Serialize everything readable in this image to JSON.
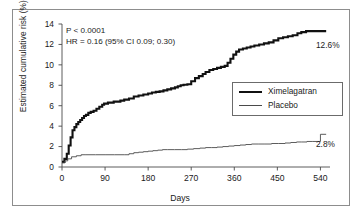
{
  "chart_data": {
    "type": "line",
    "title": "",
    "xlabel": "Days",
    "ylabel": "Estimated cumulative risk (%)",
    "xlim": [
      0,
      560
    ],
    "ylim": [
      0,
      14
    ],
    "xticks": [
      0,
      90,
      180,
      270,
      360,
      450,
      540
    ],
    "yticks": [
      0,
      2,
      4,
      6,
      8,
      10,
      12,
      14
    ],
    "xtick_labels": [
      "0",
      "90",
      "180",
      "270",
      "360",
      "450",
      "540"
    ],
    "ytick_labels": [
      "0",
      "2",
      "4",
      "6",
      "8",
      "10",
      "12",
      "14"
    ],
    "grid": false,
    "legend_position": "center-right",
    "series": [
      {
        "name": "Ximelagatran",
        "color": "#111111",
        "linewidth": 2.1,
        "endpoint_label": "12.6%",
        "endpoint_value": 12.6,
        "x": [
          0,
          5,
          10,
          14,
          18,
          22,
          26,
          30,
          34,
          38,
          42,
          46,
          50,
          55,
          60,
          66,
          72,
          78,
          84,
          88,
          92,
          96,
          102,
          108,
          114,
          122,
          130,
          140,
          150,
          160,
          170,
          180,
          188,
          196,
          204,
          212,
          220,
          228,
          236,
          242,
          248,
          254,
          262,
          270,
          278,
          286,
          294,
          300,
          308,
          316,
          324,
          332,
          340,
          346,
          352,
          358,
          364,
          370,
          378,
          386,
          394,
          402,
          412,
          422,
          432,
          442,
          452,
          462,
          472,
          482,
          492,
          500,
          510,
          520,
          530,
          540,
          552
        ],
        "y": [
          0.5,
          0.8,
          1.3,
          2.1,
          2.9,
          3.6,
          3.9,
          4.2,
          4.4,
          4.6,
          4.8,
          5.0,
          5.1,
          5.3,
          5.4,
          5.5,
          5.7,
          5.9,
          6.1,
          6.2,
          6.2,
          6.3,
          6.3,
          6.4,
          6.4,
          6.5,
          6.6,
          6.7,
          6.9,
          7.0,
          7.1,
          7.2,
          7.3,
          7.35,
          7.4,
          7.5,
          7.6,
          7.7,
          7.8,
          7.9,
          8.0,
          8.05,
          8.1,
          8.4,
          8.7,
          8.9,
          9.1,
          9.3,
          9.5,
          9.6,
          9.7,
          9.8,
          9.9,
          10.2,
          10.6,
          11.0,
          11.3,
          11.5,
          11.6,
          11.7,
          11.8,
          11.9,
          12.0,
          12.1,
          12.2,
          12.4,
          12.6,
          12.7,
          12.8,
          12.9,
          13.1,
          13.2,
          13.3,
          13.3,
          13.3,
          13.3,
          13.3
        ]
      },
      {
        "name": "Placebo",
        "color": "#4a4a4a",
        "linewidth": 0.9,
        "endpoint_label": "2.8%",
        "endpoint_value": 2.8,
        "x": [
          0,
          6,
          12,
          20,
          30,
          40,
          50,
          70,
          90,
          110,
          130,
          140,
          150,
          160,
          170,
          180,
          190,
          200,
          210,
          220,
          235,
          250,
          262,
          275,
          288,
          300,
          312,
          324,
          336,
          348,
          360,
          372,
          384,
          396,
          410,
          424,
          438,
          452,
          466,
          478,
          490,
          500,
          512,
          524,
          534,
          540,
          552
        ],
        "y": [
          0.4,
          0.6,
          0.8,
          1.0,
          1.1,
          1.2,
          1.2,
          1.2,
          1.2,
          1.2,
          1.2,
          1.3,
          1.4,
          1.45,
          1.5,
          1.55,
          1.6,
          1.65,
          1.7,
          1.7,
          1.7,
          1.7,
          1.75,
          1.8,
          1.85,
          1.9,
          1.9,
          1.95,
          2.0,
          2.05,
          2.1,
          2.15,
          2.2,
          2.25,
          2.25,
          2.25,
          2.3,
          2.3,
          2.35,
          2.4,
          2.45,
          2.45,
          2.5,
          2.5,
          2.5,
          3.2,
          3.2
        ]
      }
    ],
    "annotations": [
      {
        "id": "p_value",
        "text": "P < 0.0001"
      },
      {
        "id": "hazard_ratio",
        "text": "HR = 0.16 (95% CI 0.09; 0.30)"
      }
    ]
  },
  "legend": {
    "entries": [
      {
        "label": "Ximelagatran"
      },
      {
        "label": "Placebo"
      }
    ]
  }
}
